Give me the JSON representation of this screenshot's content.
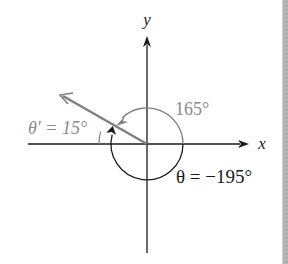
{
  "diagram": {
    "type": "reference-angle",
    "origin": [
      147,
      144
    ],
    "axes": {
      "x_label": "x",
      "y_label": "y"
    },
    "labels": {
      "positive_angle": "165°",
      "theta_equation": "θ = −195°",
      "reference_angle": "θ′ = 15°"
    },
    "angles_deg": {
      "positive": 165,
      "theta": -195,
      "reference": 15
    },
    "colors": {
      "axis": "#1a1a1a",
      "terminal_side": "#808080",
      "positive_arc": "#808080",
      "negative_arc": "#1a1a1a",
      "reference_label": "#8a8a8a",
      "positive_label": "#8a8a8a",
      "theta_label": "#1a1a1a"
    }
  }
}
